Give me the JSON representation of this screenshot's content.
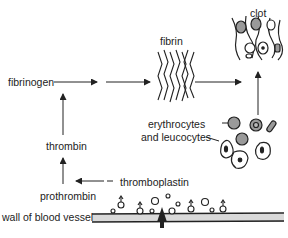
{
  "labels": {
    "clot": "clot",
    "fibrin": "fibrin",
    "fibrinogen": "fibrinogen",
    "thrombin": "thrombin",
    "prothrombin": "prothrombin",
    "thromboplastin": "thromboplastin",
    "erythrocytes": "erythrocytes",
    "and_leucocytes": "and leucocytes",
    "wall": "wall of blood vessel"
  },
  "colors": {
    "line": "#222222",
    "cell_fill": "#9a9a9a",
    "vessel_fill": "#d9d9d9"
  }
}
